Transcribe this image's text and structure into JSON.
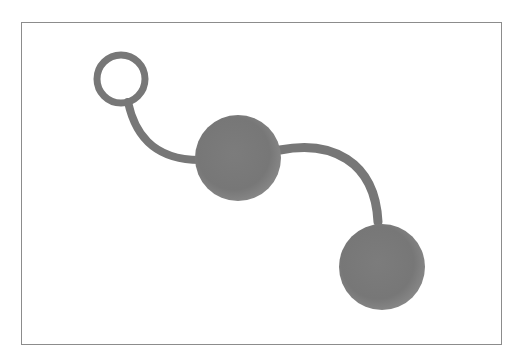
{
  "image": {
    "subject": "silicone ball pair with retrieval loop",
    "description": "Gray object with a ring loop at top-left, connected by a curved cord to a middle ball, then another curved cord to a lower-right ball",
    "colors": {
      "object": "#7a7a7a",
      "object_dark": "#666666",
      "object_light": "#8e8e8e",
      "frame_border": "#8c8c8c",
      "background": "#ffffff"
    }
  }
}
